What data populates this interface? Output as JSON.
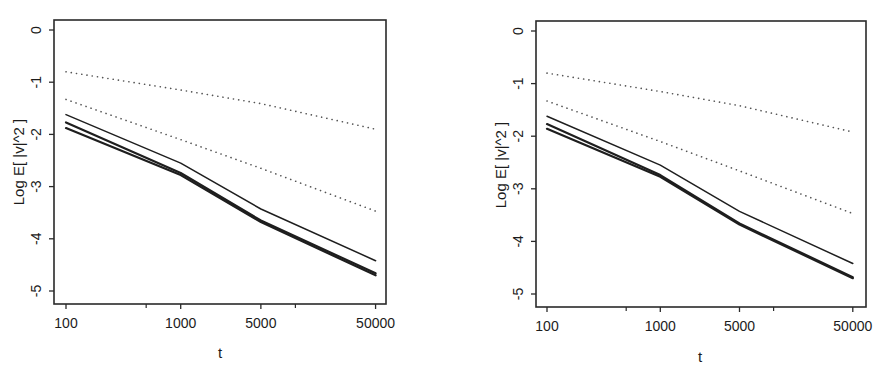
{
  "chart_data": [
    {
      "type": "line",
      "title": "",
      "xlabel": "t",
      "ylabel": "Log E[ |v|^2 ]",
      "xscale": "log",
      "xticks": [
        100,
        1000,
        5000,
        50000
      ],
      "xtick_labels": [
        "100",
        "1000",
        "5000",
        "50000"
      ],
      "xminor_ticks": [
        500,
        10000
      ],
      "yticks": [
        0,
        -1,
        -2,
        -3,
        -4,
        -5
      ],
      "ytick_labels": [
        "0",
        "-1",
        "-2",
        "-3",
        "-4",
        "-5"
      ],
      "xlim": [
        88,
        65000
      ],
      "ylim": [
        -5.25,
        0.2
      ],
      "grid": false,
      "legend": "none",
      "x": [
        100,
        1000,
        5000,
        50000
      ],
      "series": [
        {
          "name": "dotted-upper",
          "style": "dotted",
          "values": [
            -0.8,
            -1.15,
            -1.41,
            -1.9
          ]
        },
        {
          "name": "dotted-lower",
          "style": "dotted",
          "values": [
            -1.33,
            -2.1,
            -2.65,
            -3.47
          ]
        },
        {
          "name": "solid-upper",
          "style": "solid",
          "values": [
            -1.62,
            -2.55,
            -3.43,
            -4.42
          ]
        },
        {
          "name": "solid-middle",
          "style": "solid-thick",
          "values": [
            -1.77,
            -2.74,
            -3.65,
            -4.66
          ]
        },
        {
          "name": "solid-lower",
          "style": "solid-thick",
          "values": [
            -1.88,
            -2.78,
            -3.68,
            -4.7
          ]
        }
      ]
    },
    {
      "type": "line",
      "title": "",
      "xlabel": "t",
      "ylabel": "Log E[ |v|^2 ]",
      "xscale": "log",
      "xticks": [
        100,
        1000,
        5000,
        50000
      ],
      "xtick_labels": [
        "100",
        "1000",
        "5000",
        "50000"
      ],
      "xminor_ticks": [
        500,
        10000
      ],
      "yticks": [
        0,
        -1,
        -2,
        -3,
        -4,
        -5
      ],
      "ytick_labels": [
        "0",
        "-1",
        "-2",
        "-3",
        "-4",
        "-5"
      ],
      "xlim": [
        88,
        65000
      ],
      "ylim": [
        -5.25,
        0.2
      ],
      "grid": false,
      "legend": "none",
      "x": [
        100,
        1000,
        5000,
        50000
      ],
      "series": [
        {
          "name": "dotted-upper",
          "style": "dotted",
          "values": [
            -0.8,
            -1.15,
            -1.42,
            -1.92
          ]
        },
        {
          "name": "dotted-lower",
          "style": "dotted",
          "values": [
            -1.33,
            -2.1,
            -2.66,
            -3.47
          ]
        },
        {
          "name": "solid-upper",
          "style": "solid",
          "values": [
            -1.62,
            -2.55,
            -3.43,
            -4.42
          ]
        },
        {
          "name": "solid-middle",
          "style": "solid-thick",
          "values": [
            -1.77,
            -2.74,
            -3.66,
            -4.68
          ]
        },
        {
          "name": "solid-lower",
          "style": "solid-thick",
          "values": [
            -1.86,
            -2.77,
            -3.68,
            -4.7
          ]
        }
      ]
    }
  ],
  "panels": [
    {
      "xlabel": "t",
      "ylabel": "Log E[ |v|^2 ]"
    },
    {
      "xlabel": "t",
      "ylabel": "Log E[ |v|^2 ]"
    }
  ],
  "colors": {
    "line": "#1e1e1e",
    "dotted": "#555555",
    "axis": "#2a2a2a"
  }
}
